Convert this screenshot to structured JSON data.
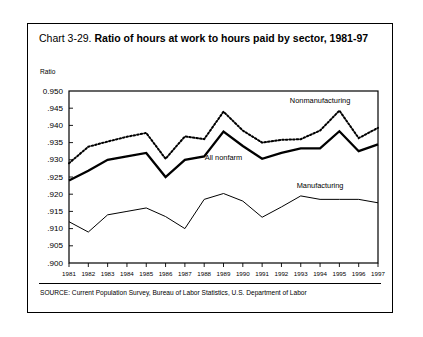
{
  "figure": {
    "title_prefix": "Chart 3-29. ",
    "title_main": "Ratio of hours at work to hours paid by sector, 1981-97",
    "axis_unit_label": "Ratio",
    "source_note": "SOURCE: Current Population Survey, Bureau of Labor Statistics, U.S. Department of Labor",
    "series_label_nonmanufacturing": "Nonmanufacturing",
    "series_label_all_nonfarm": "All nonfarm",
    "series_label_manufacturing": "Manufacturing"
  },
  "chart_data": {
    "type": "line",
    "title": "Chart 3-29. Ratio of hours at work to hours paid by sector, 1981-97",
    "xlabel": "",
    "ylabel": "Ratio",
    "ylim": [
      0.9,
      0.95
    ],
    "ytick_step": 0.005,
    "ytick_labels": [
      "0.950",
      ".945",
      ".940",
      ".935",
      ".930",
      ".925",
      ".920",
      ".915",
      ".910",
      ".905",
      ".900"
    ],
    "ytick_values": [
      0.95,
      0.945,
      0.94,
      0.935,
      0.93,
      0.925,
      0.92,
      0.915,
      0.91,
      0.905,
      0.9
    ],
    "grid": false,
    "legend": "inline-annotations",
    "categories": [
      1981,
      1982,
      1983,
      1984,
      1985,
      1986,
      1987,
      1988,
      1989,
      1990,
      1991,
      1992,
      1993,
      1994,
      1995,
      1996,
      1997
    ],
    "xtick_labels": [
      "1981",
      "1982",
      "1983",
      "1984",
      "1985",
      "1986",
      "1987",
      "1988",
      "1989",
      "1990",
      "1991",
      "1992",
      "1993",
      "1994",
      "1995",
      "1996",
      "1997"
    ],
    "series": [
      {
        "name": "Nonmanufacturing",
        "style": "dotted",
        "values": [
          0.929,
          0.9338,
          0.9353,
          0.9367,
          0.9378,
          0.9303,
          0.9368,
          0.936,
          0.944,
          0.9385,
          0.935,
          0.9358,
          0.936,
          0.9385,
          0.9443,
          0.9363,
          0.9393
        ]
      },
      {
        "name": "All nonfarm",
        "style": "solid-thick",
        "values": [
          0.924,
          0.9268,
          0.93,
          0.931,
          0.932,
          0.925,
          0.93,
          0.931,
          0.9382,
          0.934,
          0.9303,
          0.932,
          0.9333,
          0.9333,
          0.9383,
          0.9325,
          0.9345
        ]
      },
      {
        "name": "Manufacturing",
        "style": "solid-thin",
        "values": [
          0.912,
          0.909,
          0.914,
          0.915,
          0.916,
          0.9135,
          0.91,
          0.9185,
          0.9202,
          0.918,
          0.9133,
          0.9163,
          0.9195,
          0.9185,
          0.9185,
          0.9185,
          0.9175
        ]
      }
    ],
    "annotations": [
      {
        "text": "Nonmanufacturing",
        "x": 1994,
        "y": 0.9465
      },
      {
        "text": "All nonfarm",
        "x": 1989,
        "y": 0.9298
      },
      {
        "text": "Manufacturing",
        "x": 1994,
        "y": 0.9218
      }
    ]
  }
}
